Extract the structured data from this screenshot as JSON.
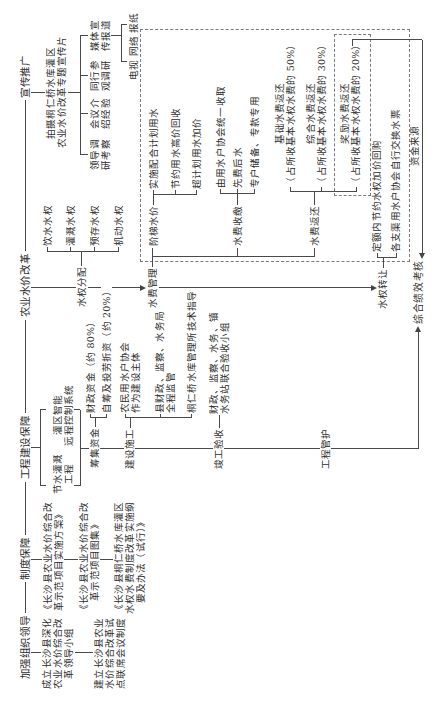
{
  "spine": {
    "leadership": "加强组织领导",
    "institution": "制度保障",
    "engineering": "工程建设保障",
    "reform": "农业水价改革",
    "publicity": "宣传推广"
  },
  "leadership": {
    "items": [
      {
        "lines": [
          "成立长沙县深化",
          "农业水价综合改",
          "革领导小组"
        ]
      },
      {
        "lines": [
          "建立长沙县农业",
          "水价综合改革试",
          "点联席会议制度"
        ]
      }
    ]
  },
  "institution": {
    "documents": [
      {
        "lines": [
          "《长沙县农业水价综合改",
          "革示范项目实施方案》"
        ]
      },
      {
        "lines": [
          "《长沙县农业水价综合改",
          "革示范项目图集》"
        ]
      },
      {
        "lines": [
          "《长沙县桐仁桥水库灌区",
          "水权水费制度改革实施纲",
          "要及办法（试行）》"
        ]
      }
    ]
  },
  "engineering": {
    "projects": [
      {
        "lines": [
          "节水灌溉",
          "工程"
        ]
      },
      {
        "lines": [
          "灌区智能",
          "远程控制系统"
        ]
      }
    ],
    "funding": {
      "label": "筹集资金",
      "items": [
        "财政资金（约 80%）",
        "自筹及投劳折资（约 20%）"
      ]
    },
    "construction": {
      "label": "建设施工",
      "items": [
        {
          "lines": [
            "农民用水户协会",
            "作为建设主体"
          ]
        },
        {
          "lines": [
            "县财政、监察、水务局",
            "全程监管"
          ]
        },
        {
          "lines": [
            "桐仁桥水库管理所技术指导"
          ]
        }
      ]
    },
    "acceptance": {
      "label": "竣工验收",
      "lines": [
        "财政、监察、水务、镇",
        "水务站联合验收小组"
      ]
    },
    "maintenance": "工程管护"
  },
  "reform": {
    "allocation": {
      "label": "水权分配",
      "items": [
        "饮水水权",
        "灌溉水权",
        "预存水权",
        "机动水权"
      ]
    },
    "fee_management": {
      "label": "水费管理",
      "tiered_pricing": {
        "label": "阶梯水价",
        "items": [
          "实施配合计划用水",
          "节约用水高价回收",
          "超计划用水加价"
        ]
      },
      "collection": {
        "label": "水费收缴",
        "items": [
          "由用水户协会统一收取",
          "先费后水",
          "专户储备、专款专用"
        ]
      },
      "refund": {
        "label": "水费返还",
        "items": [
          {
            "title": "基础水费返还",
            "note": "（占所收基本水权水费的 50%）"
          },
          {
            "title": "综合水费返还",
            "note": "（占所收基本水权水费的 30%）"
          },
          {
            "title": "奖励水费返还",
            "note": "（占所收基本水权水费的 20%）"
          }
        ]
      }
    },
    "transfer": {
      "label": "水权转让",
      "items": [
        "定额内节约水权加价回购",
        "各支渠用水户协会自行交换水票"
      ]
    },
    "fund_source": "资金来源",
    "assessment": "综合绩效考核"
  },
  "publicity": {
    "film": {
      "lines": [
        "拍摄桐仁桥水库灌区",
        "农业水价改革专题宣传片"
      ]
    },
    "activities": [
      {
        "lines": [
          "领导调",
          "研考察"
        ]
      },
      {
        "lines": [
          "会议介",
          "绍经验"
        ]
      },
      {
        "lines": [
          "同行参",
          "观调研"
        ]
      },
      {
        "lines": [
          "媒体宣",
          "传报道"
        ]
      }
    ],
    "media": "电视 网络 报纸"
  }
}
